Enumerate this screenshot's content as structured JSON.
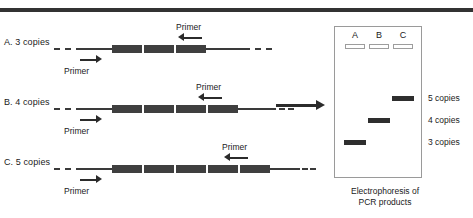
{
  "figure": {
    "top_rule_color": "#333333",
    "line_color": "#3a3a3a",
    "block_color": "#3f3f3f"
  },
  "pcr_rows": [
    {
      "label": "A. 3 copies",
      "copies": 3,
      "forward_primer_label": "Primer",
      "reverse_primer_label": "Primer"
    },
    {
      "label": "B. 4 copies",
      "copies": 4,
      "forward_primer_label": "Primer",
      "reverse_primer_label": "Primer"
    },
    {
      "label": "C. 5 copies",
      "copies": 5,
      "forward_primer_label": "Primer",
      "reverse_primer_label": "Primer"
    }
  ],
  "connector": {
    "icon": "right-arrow-icon"
  },
  "gel": {
    "lanes": [
      {
        "letter": "A",
        "copies": 3
      },
      {
        "letter": "B",
        "copies": 4
      },
      {
        "letter": "C",
        "copies": 5
      }
    ],
    "size_labels": [
      "5 copies",
      "4 copies",
      "3 copies"
    ],
    "caption_line1": "Electrophoresis of",
    "caption_line2": "PCR products"
  }
}
